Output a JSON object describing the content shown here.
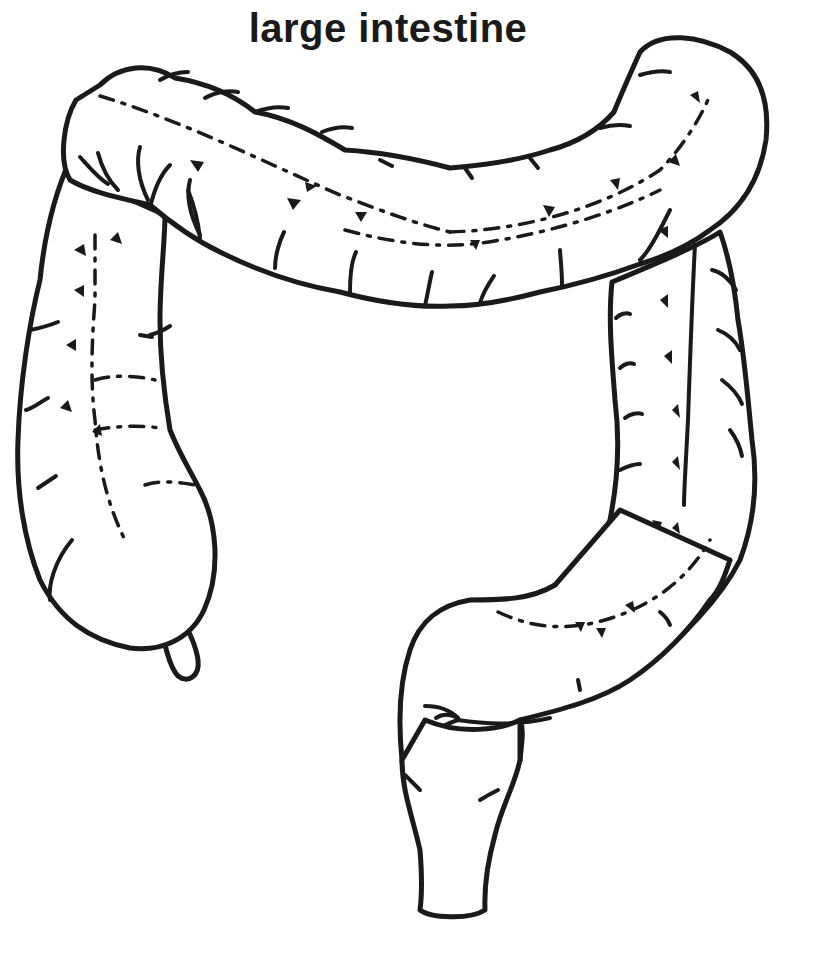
{
  "diagram": {
    "title": "large intestine",
    "style": "black line art on white background",
    "colors": {
      "ink": "#1a1a1a",
      "background": "#ffffff"
    },
    "parts_depicted": [
      "cecum with appendix",
      "ascending colon",
      "transverse colon",
      "descending colon",
      "sigmoid colon",
      "rectum"
    ]
  }
}
